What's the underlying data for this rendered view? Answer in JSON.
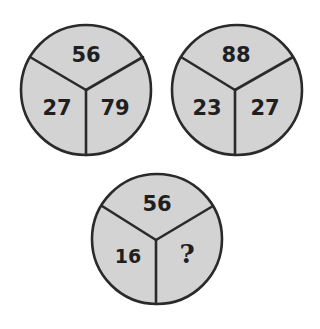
{
  "puzzle": {
    "circles": [
      {
        "top": "56",
        "left": "27",
        "right": "79"
      },
      {
        "top": "88",
        "left": "23",
        "right": "27"
      },
      {
        "top": "56",
        "left": "16",
        "right": "?"
      }
    ],
    "colors": {
      "fill": "#d3d3d3",
      "stroke": "#2a2a2a",
      "text": "#1f1f1f",
      "background": "#ffffff"
    }
  }
}
